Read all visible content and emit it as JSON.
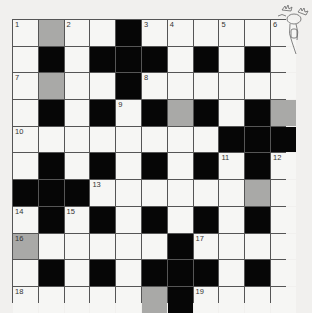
{
  "puzzle": {
    "type": "crossword",
    "rows": 11,
    "cols": 11,
    "grid": [
      [
        "W",
        "G",
        "W",
        "W",
        "B",
        "W",
        "W",
        "W",
        "W",
        "W",
        "W"
      ],
      [
        "W",
        "B",
        "W",
        "B",
        "B",
        "B",
        "W",
        "B",
        "W",
        "B",
        "W"
      ],
      [
        "W",
        "G",
        "W",
        "W",
        "B",
        "W",
        "W",
        "W",
        "W",
        "W",
        "W"
      ],
      [
        "W",
        "B",
        "W",
        "B",
        "W",
        "B",
        "G",
        "B",
        "W",
        "B",
        "G"
      ],
      [
        "W",
        "W",
        "W",
        "W",
        "W",
        "W",
        "W",
        "W",
        "B",
        "B",
        "B"
      ],
      [
        "W",
        "B",
        "W",
        "B",
        "W",
        "B",
        "W",
        "B",
        "W",
        "B",
        "W"
      ],
      [
        "B",
        "B",
        "B",
        "W",
        "W",
        "W",
        "W",
        "W",
        "W",
        "G",
        "W"
      ],
      [
        "W",
        "B",
        "W",
        "B",
        "W",
        "B",
        "W",
        "B",
        "W",
        "B",
        "W"
      ],
      [
        "G",
        "W",
        "W",
        "W",
        "W",
        "W",
        "B",
        "W",
        "W",
        "W",
        "W"
      ],
      [
        "W",
        "B",
        "W",
        "B",
        "W",
        "B",
        "B",
        "B",
        "W",
        "B",
        "W"
      ],
      [
        "W",
        "W",
        "W",
        "W",
        "W",
        "G",
        "B",
        "W",
        "W",
        "W",
        "W"
      ]
    ],
    "numbers": [
      {
        "r": 0,
        "c": 0,
        "n": "1"
      },
      {
        "r": 0,
        "c": 2,
        "n": "2"
      },
      {
        "r": 0,
        "c": 5,
        "n": "3"
      },
      {
        "r": 0,
        "c": 6,
        "n": "4"
      },
      {
        "r": 0,
        "c": 8,
        "n": "5"
      },
      {
        "r": 0,
        "c": 10,
        "n": "6"
      },
      {
        "r": 2,
        "c": 0,
        "n": "7"
      },
      {
        "r": 2,
        "c": 5,
        "n": "8"
      },
      {
        "r": 3,
        "c": 4,
        "n": "9"
      },
      {
        "r": 4,
        "c": 0,
        "n": "10"
      },
      {
        "r": 5,
        "c": 8,
        "n": "11"
      },
      {
        "r": 5,
        "c": 10,
        "n": "12"
      },
      {
        "r": 6,
        "c": 3,
        "n": "13"
      },
      {
        "r": 7,
        "c": 0,
        "n": "14"
      },
      {
        "r": 7,
        "c": 2,
        "n": "15"
      },
      {
        "r": 8,
        "c": 0,
        "n": "16"
      },
      {
        "r": 8,
        "c": 7,
        "n": "17"
      },
      {
        "r": 10,
        "c": 0,
        "n": "18"
      },
      {
        "r": 10,
        "c": 7,
        "n": "19"
      }
    ],
    "colors": {
      "white": "#f6f6f4",
      "black": "#060606",
      "gray": "#a9a9a7",
      "background": "#f1f0ee"
    },
    "decoration": "moose-mascot-icon"
  }
}
